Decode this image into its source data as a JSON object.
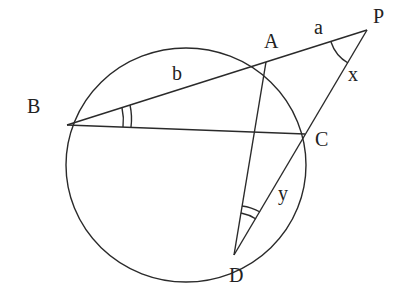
{
  "diagram": {
    "stroke_color": "#2a2a2a",
    "background": "#ffffff",
    "points": {
      "P": {
        "label": "P",
        "x": 367,
        "y": 30
      },
      "A": {
        "label": "A",
        "x": 266,
        "y": 62
      },
      "B": {
        "label": "B",
        "x": 67,
        "y": 125
      },
      "C": {
        "label": "C",
        "x": 305,
        "y": 134
      },
      "D": {
        "label": "D",
        "x": 234,
        "y": 255
      }
    },
    "circle": {
      "cx": 186,
      "cy": 165,
      "rx": 120,
      "ry": 117
    },
    "segment_labels": {
      "a": "a",
      "b": "b"
    },
    "angle_labels": {
      "x": "x",
      "y": "y"
    },
    "segments": [
      "PB",
      "PD",
      "BC",
      "AD"
    ]
  }
}
